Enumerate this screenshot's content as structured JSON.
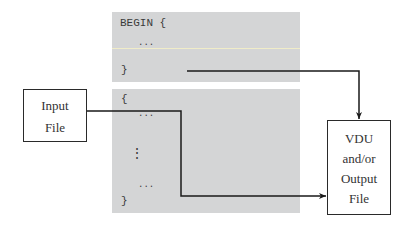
{
  "begin_block": {
    "open": "BEGIN {",
    "body": "...",
    "close": "}"
  },
  "main_block": {
    "open": "{",
    "lines": [
      "...",
      "⋮",
      "..."
    ],
    "close": "}"
  },
  "input_box": {
    "lines": [
      "Input",
      "File"
    ]
  },
  "output_box": {
    "lines": [
      "VDU",
      "and/or",
      "Output",
      "File"
    ]
  },
  "colors": {
    "block_fill": "#d4d5d6",
    "line": "#1a1a1a"
  }
}
